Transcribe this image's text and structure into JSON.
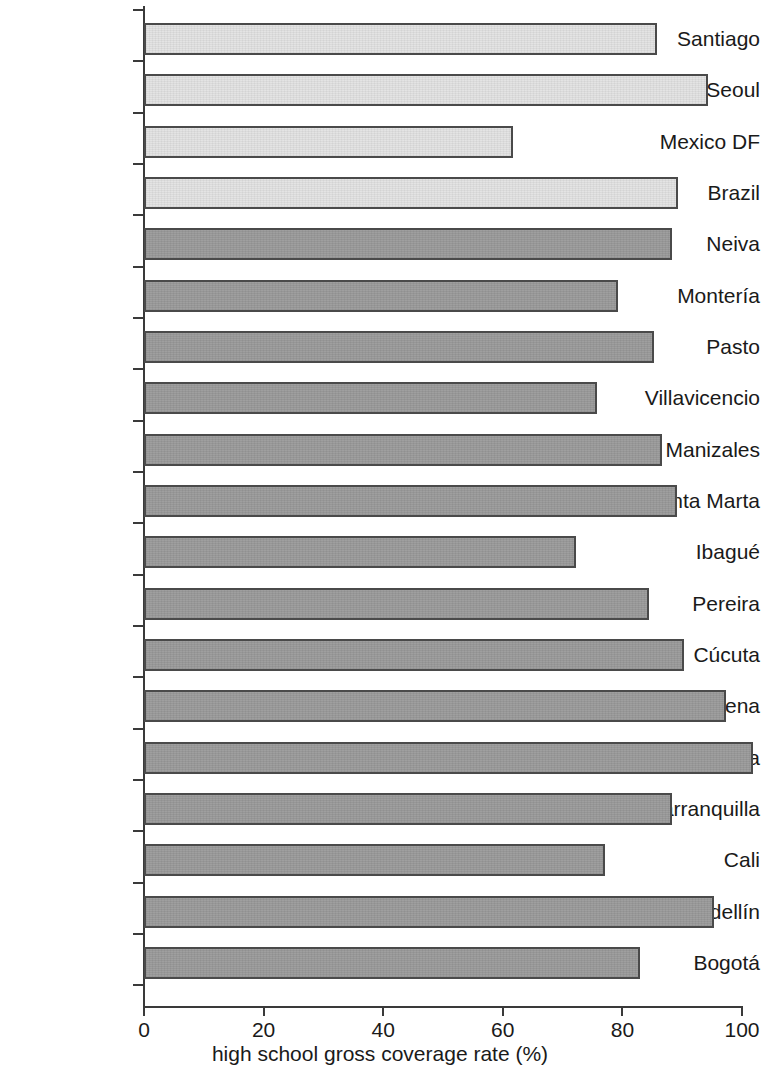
{
  "chart_data": {
    "type": "bar",
    "orientation": "horizontal",
    "title": "",
    "xlabel": "high school gross coverage rate (%)",
    "ylabel": "",
    "xlim": [
      0,
      100
    ],
    "xticks": [
      0,
      20,
      40,
      60,
      80,
      100
    ],
    "xtick_labels": [
      "0",
      "20",
      "40",
      "60",
      "80",
      "100"
    ],
    "grid": false,
    "legend": false,
    "categories": [
      "Santiago",
      "Seoul",
      "Mexico DF",
      "Brazil",
      "Neiva",
      "Montería",
      "Pasto",
      "Villavicencio",
      "Manizales",
      "Santa Marta",
      "Ibagué",
      "Pereira",
      "Cúcuta",
      "Cartagena",
      "Bucaramanga",
      "Barranquilla",
      "Cali",
      "Medellín",
      "Bogotá"
    ],
    "values": [
      85.8,
      94.3,
      61.7,
      89.3,
      88.3,
      79.3,
      85.3,
      75.8,
      86.6,
      89.1,
      72.2,
      84.4,
      90.3,
      97.3,
      101.8,
      88.3,
      77.1,
      95.3,
      82.9
    ],
    "bar_styles": [
      "light",
      "light",
      "light",
      "light",
      "dark",
      "dark",
      "dark",
      "dark",
      "dark",
      "dark",
      "dark",
      "dark",
      "dark",
      "dark",
      "dark",
      "dark",
      "dark",
      "dark",
      "dark"
    ],
    "colors": {
      "light_bar": "#e2e2e2",
      "dark_bar": "#9a9a9a",
      "bar_border": "#4a4a4a",
      "axis": "#3a3a3a",
      "text": "#1a1a1a",
      "background": "#ffffff"
    }
  }
}
